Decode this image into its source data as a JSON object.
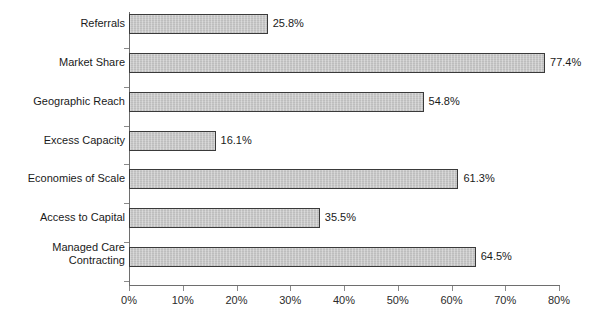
{
  "chart_data": {
    "type": "bar",
    "orientation": "horizontal",
    "title": "",
    "xlabel": "",
    "ylabel": "",
    "xlim": [
      0,
      80
    ],
    "xticks": [
      "0%",
      "10%",
      "20%",
      "30%",
      "40%",
      "50%",
      "60%",
      "70%",
      "80%"
    ],
    "xtick_values": [
      0,
      10,
      20,
      30,
      40,
      50,
      60,
      70,
      80
    ],
    "grid": false,
    "legend": false,
    "categories": [
      "Referrals",
      "Market Share",
      "Geographic Reach",
      "Excess Capacity",
      "Economies of Scale",
      "Access to Capital",
      "Managed Care\nContracting"
    ],
    "values": [
      25.8,
      77.4,
      54.8,
      16.1,
      61.3,
      35.5,
      64.5
    ],
    "data_labels": [
      "25.8%",
      "77.4%",
      "54.8%",
      "16.1%",
      "61.3%",
      "35.5%",
      "64.5%"
    ],
    "bar_color": "#c9c9c9",
    "bar_border_color": "#3a3a3a",
    "axis_color": "#6e6e6e",
    "text_color": "#1a1a1a"
  }
}
